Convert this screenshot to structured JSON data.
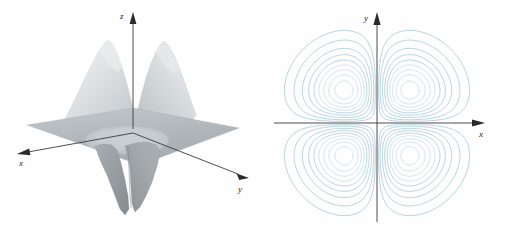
{
  "figure": {
    "background_color": "#fefeff",
    "panels": [
      {
        "id": "surface",
        "kind": "3d-surface"
      },
      {
        "id": "contour",
        "kind": "contour-map"
      }
    ]
  },
  "surface_panel": {
    "name": "three-dimensional-surface-plot",
    "axes": {
      "x": {
        "label": "x",
        "direction": "left-down",
        "arrow": true
      },
      "y": {
        "label": "y",
        "direction": "right-down",
        "arrow": true
      },
      "z": {
        "label": "z",
        "direction": "up",
        "arrow": true
      }
    },
    "surface": {
      "fill_plane": "#b7bcc0",
      "fill_peak": "#d9dde0",
      "fill_valley": "#8f9499",
      "edge_color": "#9aa0a4",
      "peaks": 2,
      "valleys": 2,
      "description": "Two light gray peaks above the reference plane and two darker valleys below it"
    }
  },
  "contour_panel": {
    "name": "contour-map-plot",
    "axes": {
      "x": {
        "label": "x",
        "direction": "right",
        "arrow": true
      },
      "y": {
        "label": "y",
        "direction": "up",
        "arrow": true
      }
    },
    "contour": {
      "line_color": "#7fb2c3",
      "line_color_dense": "#a9cdd9",
      "levels": 18,
      "lobes": 4,
      "lobe_centers": [
        {
          "x": -0.71,
          "y": 0.71,
          "sign": "negative"
        },
        {
          "x": 0.71,
          "y": 0.71,
          "sign": "positive"
        },
        {
          "x": -0.71,
          "y": -0.71,
          "sign": "positive"
        },
        {
          "x": 0.71,
          "y": -0.71,
          "sign": "negative"
        }
      ]
    }
  },
  "chart_data": {
    "type": "contour",
    "title": "",
    "xlabel": "x",
    "ylabel": "y",
    "zlabel": "z",
    "function": "f(x,y) = x*y*exp(-x^2 - y^2)",
    "xlim": [
      -2.2,
      2.2
    ],
    "ylim": [
      -2.2,
      2.2
    ],
    "zlim": [
      -0.18,
      0.18
    ],
    "grid": false,
    "legend": "none",
    "levels": [
      -0.17,
      -0.15,
      -0.13,
      -0.11,
      -0.09,
      -0.07,
      -0.05,
      -0.03,
      -0.015,
      0.015,
      0.03,
      0.05,
      0.07,
      0.09,
      0.11,
      0.13,
      0.15,
      0.17
    ],
    "critical_points": [
      {
        "x": -0.707,
        "y": 0.707,
        "z": -0.1839,
        "type": "minimum"
      },
      {
        "x": 0.707,
        "y": 0.707,
        "z": 0.1839,
        "type": "maximum"
      },
      {
        "x": -0.707,
        "y": -0.707,
        "z": 0.1839,
        "type": "maximum"
      },
      {
        "x": 0.707,
        "y": -0.707,
        "z": -0.1839,
        "type": "minimum"
      },
      {
        "x": 0.0,
        "y": 0.0,
        "z": 0.0,
        "type": "saddle"
      }
    ],
    "series": [
      {
        "name": "contour-lobe-upper-left",
        "center": [
          -0.71,
          0.71
        ],
        "rings": 18
      },
      {
        "name": "contour-lobe-upper-right",
        "center": [
          0.71,
          0.71
        ],
        "rings": 18
      },
      {
        "name": "contour-lobe-lower-left",
        "center": [
          -0.71,
          -0.71
        ],
        "rings": 18
      },
      {
        "name": "contour-lobe-lower-right",
        "center": [
          0.71,
          -0.71
        ],
        "rings": 18
      }
    ]
  }
}
